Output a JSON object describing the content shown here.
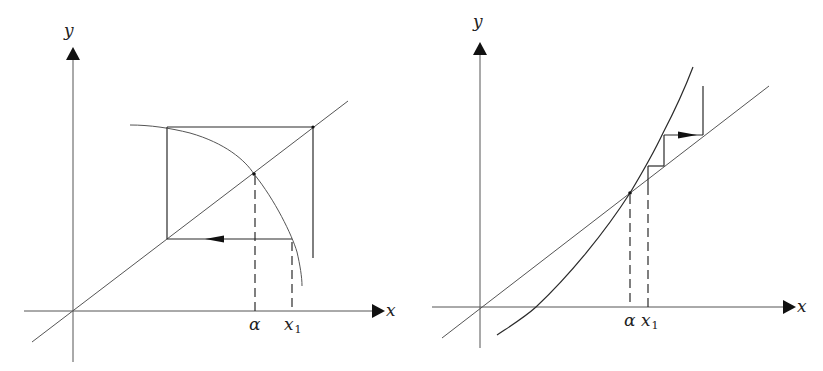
{
  "figure": {
    "colors": {
      "ink": "#222222",
      "background": "#ffffff"
    }
  },
  "left_panel": {
    "y_axis_label": "y",
    "x_axis_label": "x",
    "alpha_label": "α",
    "x1_label": "x",
    "x1_subscript": "1",
    "curve": "decreasing concave curve y = g(x) crossing y = x at α",
    "behaviour": "cobweb spirals around fixed point α (oscillating, diverging square)"
  },
  "right_panel": {
    "y_axis_label": "y",
    "x_axis_label": "x",
    "alpha_label": "α",
    "x1_label": "x",
    "x1_subscript": "1",
    "curve": "increasing convex curve y = g(x) crossing y = x at α with slope > 1",
    "behaviour": "staircase moving away from α (monotonic divergence)"
  }
}
